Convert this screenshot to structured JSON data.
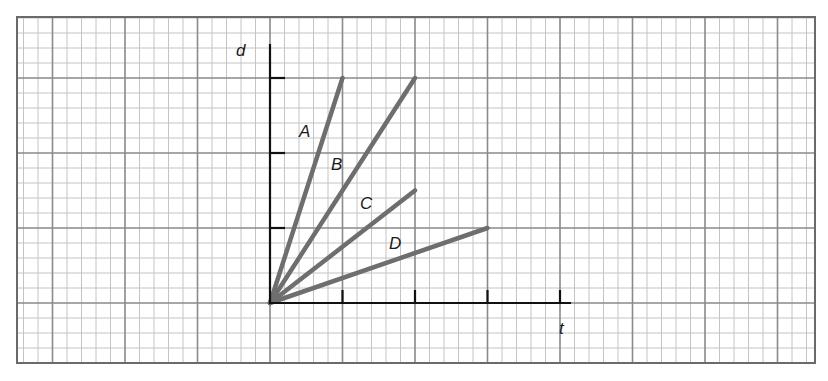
{
  "chart_data": {
    "type": "line",
    "title": "",
    "xlabel": "t",
    "ylabel": "d",
    "xlim": [
      0,
      4
    ],
    "ylim": [
      0,
      3
    ],
    "x_ticks": [
      1,
      2,
      3,
      4
    ],
    "y_ticks": [
      1,
      2,
      3
    ],
    "tick_labels_shown": false,
    "grid": true,
    "legend": "inline labels near lines",
    "series": [
      {
        "name": "A",
        "x": [
          0,
          1
        ],
        "y": [
          0,
          3
        ],
        "color": "#6e6e6e"
      },
      {
        "name": "B",
        "x": [
          0,
          2
        ],
        "y": [
          0,
          3
        ],
        "color": "#6e6e6e"
      },
      {
        "name": "C",
        "x": [
          0,
          2
        ],
        "y": [
          0,
          1.5
        ],
        "color": "#6e6e6e"
      },
      {
        "name": "D",
        "x": [
          0,
          3
        ],
        "y": [
          0,
          1
        ],
        "color": "#6e6e6e"
      }
    ]
  },
  "labels": {
    "x_axis": "t",
    "y_axis": "d",
    "line_a": "A",
    "line_b": "B",
    "line_c": "C",
    "line_d": "D"
  },
  "colors": {
    "grid_minor": "#c4c4c4",
    "grid_major": "#8a8a8a",
    "border": "#6a6a6a",
    "axis": "#111111",
    "lines": "#6e6e6e"
  }
}
